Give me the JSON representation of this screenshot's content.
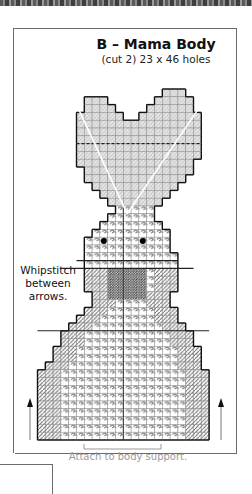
{
  "header": {
    "title": "B – Mama Body",
    "subtitle": "(cut 2) 23 x 46 holes"
  },
  "annotations": {
    "whipstitch_note": [
      "Whipstitch",
      "between",
      "arrows."
    ],
    "attach_note": "Attach to body support."
  },
  "pattern": {
    "piece": "B",
    "name": "Mama Body",
    "cut_count": 2,
    "width_holes": 23,
    "height_holes": 46,
    "icons": [
      "arrow-up-icon-left",
      "arrow-up-icon-right"
    ],
    "colors": {
      "outline": "#111111",
      "grid": "#8c8c8c",
      "diagonal_stitch": "#6e6e6e",
      "dark_patch": "#555555",
      "eye": "#000000",
      "attach_text": "#9a9a9a",
      "frame": "#6b6b6b"
    }
  }
}
